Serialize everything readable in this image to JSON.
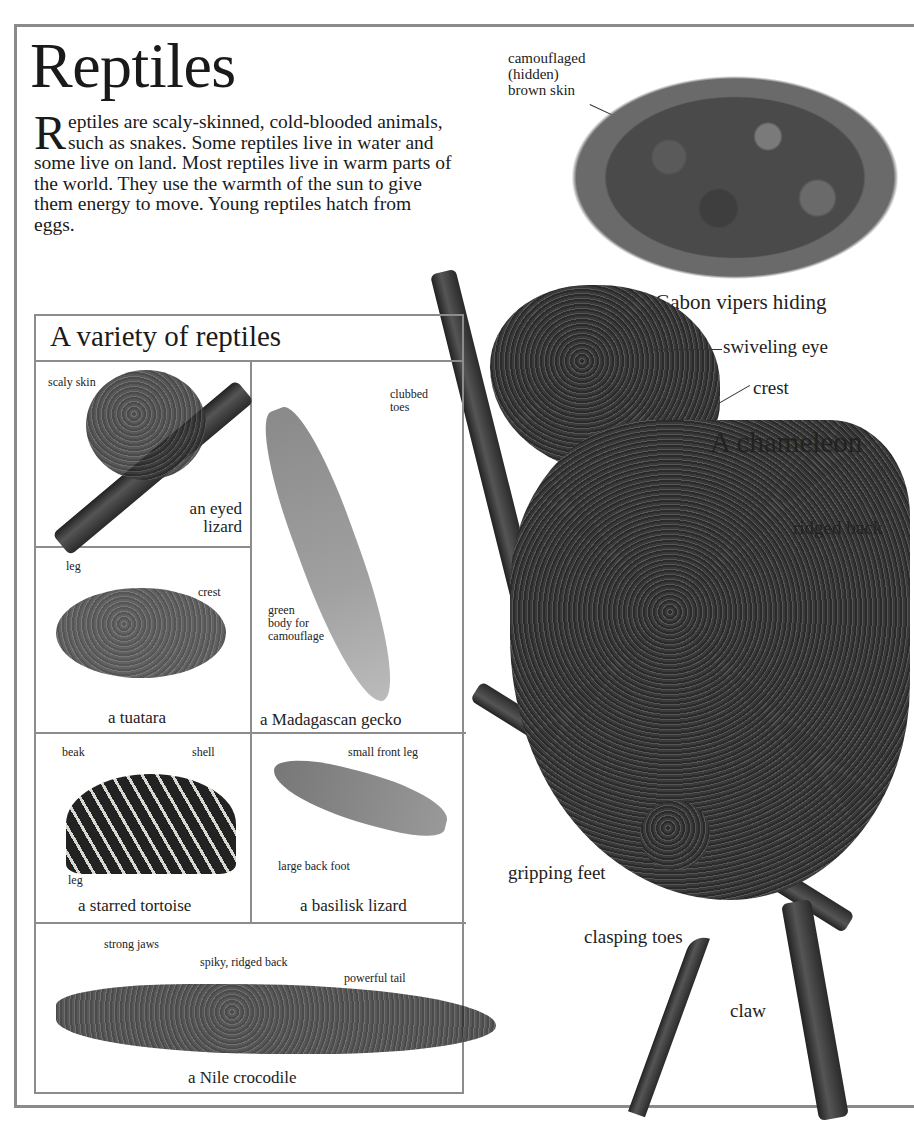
{
  "page": {
    "title": "Reptiles",
    "intro": {
      "dropcap": "R",
      "text": "eptiles are scaly-skinned, cold-blooded animals, such as snakes. Some reptiles live in water and some live on land. Most reptiles live in warm parts of the world. They use the warmth of the sun to give them energy to move. Young reptiles hatch from eggs."
    }
  },
  "gabon": {
    "label": "camouflaged (hidden) brown skin",
    "label_lines": [
      "camouflaged",
      "(hidden)",
      "brown skin"
    ],
    "caption": "Gabon vipers hiding"
  },
  "chameleon": {
    "caption": "A chameleon",
    "labels": {
      "eye": "swiveling eye",
      "crest": "crest",
      "back": "ridged back",
      "feet": "gripping feet",
      "toes": "clasping toes",
      "claw": "claw"
    }
  },
  "variety": {
    "title": "A variety of reptiles",
    "cells": [
      {
        "caption_lines": [
          "an eyed",
          "lizard"
        ],
        "labels": [
          "scaly skin"
        ]
      },
      {
        "caption": "a Madagascan gecko",
        "labels": [
          "clubbed toes",
          "green body for camouflage"
        ],
        "label_lines_toes": [
          "clubbed",
          "toes"
        ],
        "label_lines_body": [
          "green",
          "body for",
          "camouflage"
        ]
      },
      {
        "caption": "a tuatara",
        "labels": [
          "leg",
          "crest"
        ]
      },
      {
        "caption": "a starred tortoise",
        "labels": [
          "beak",
          "shell",
          "leg"
        ]
      },
      {
        "caption": "a basilisk lizard",
        "labels": [
          "small front leg",
          "large back foot"
        ]
      },
      {
        "caption": "a Nile crocodile",
        "labels": [
          "strong jaws",
          "spiky, ridged back",
          "powerful tail"
        ]
      }
    ]
  }
}
